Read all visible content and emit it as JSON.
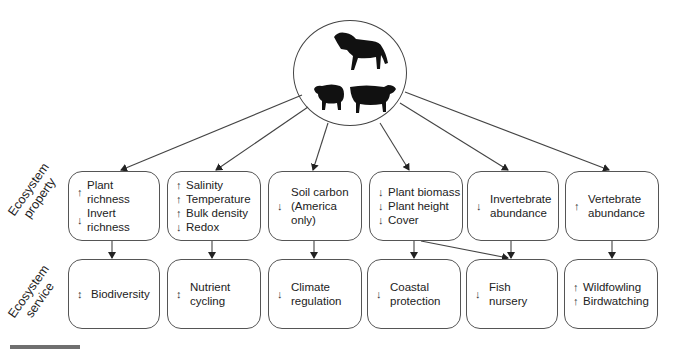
{
  "row_labels": {
    "property": [
      "Ecosystem",
      "property"
    ],
    "service": [
      "Ecosystem",
      "service"
    ]
  },
  "herbivores": {
    "icons": [
      "horse-icon",
      "sheep-icon",
      "cow-icon"
    ]
  },
  "properties": [
    {
      "items": [
        {
          "dir": "↑",
          "text": "Plant richness"
        },
        {
          "dir": "↓",
          "text": "Invert richness"
        }
      ]
    },
    {
      "items": [
        {
          "dir": "↑",
          "text": "Salinity"
        },
        {
          "dir": "↑",
          "text": "Temperature"
        },
        {
          "dir": "↑",
          "text": "Bulk density"
        },
        {
          "dir": "↓",
          "text": "Redox"
        }
      ]
    },
    {
      "dir": "↓",
      "lines": [
        "Soil carbon",
        "(America only)"
      ]
    },
    {
      "items": [
        {
          "dir": "↓",
          "text": "Plant biomass"
        },
        {
          "dir": "↓",
          "text": "Plant height"
        },
        {
          "dir": "↓",
          "text": "Cover"
        }
      ]
    },
    {
      "dir": "↓",
      "lines": [
        "Invertebrate",
        "abundance"
      ]
    },
    {
      "dir": "↑",
      "lines": [
        "Vertebrate",
        "abundance"
      ]
    }
  ],
  "services": [
    {
      "dir": "↕",
      "lines": [
        "Biodiversity"
      ]
    },
    {
      "dir": "↕",
      "lines": [
        "Nutrient",
        "cycling"
      ]
    },
    {
      "dir": "↓",
      "lines": [
        "Climate",
        "regulation"
      ]
    },
    {
      "dir": "↓",
      "lines": [
        "Coastal",
        "protection"
      ]
    },
    {
      "dir": "↓",
      "lines": [
        "Fish",
        "nursery"
      ]
    },
    {
      "items": [
        {
          "dir": "↑",
          "text": "Wildfowling"
        },
        {
          "dir": "↑",
          "text": "Birdwatching"
        }
      ]
    }
  ],
  "colors": {
    "line": "#444444",
    "box_border": "#555555",
    "scalebar": "#6f6f6f"
  }
}
